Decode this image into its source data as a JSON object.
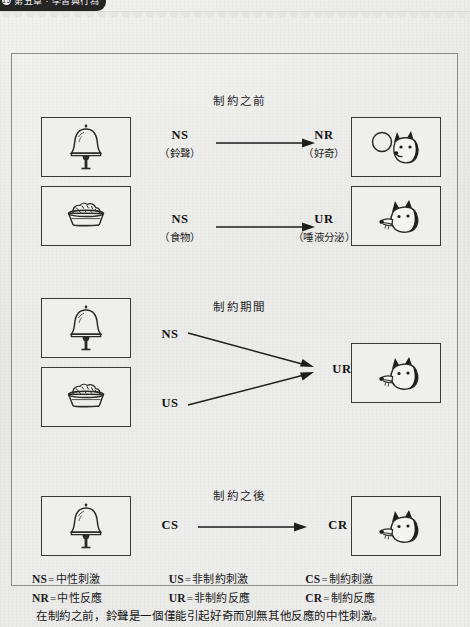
{
  "header": {
    "tab_badge": "15",
    "tab_label": "第五章 · 學習與行為"
  },
  "diagram": {
    "title_before": "制約之前",
    "title_during": "制約期間",
    "title_after": "制約之後",
    "rows": [
      {
        "id": "before-bell",
        "left_image": "bell-illustration",
        "stimulus_abbr": "NS",
        "stimulus_zh": "（鈴聲）",
        "response_abbr": "NR",
        "response_zh": "（好奇）",
        "right_image": "dog-curious-illustration"
      },
      {
        "id": "before-food",
        "left_image": "food-bowl-illustration",
        "stimulus_abbr": "NS",
        "stimulus_zh": "（食物）",
        "response_abbr": "UR",
        "response_zh": "（唾液分泌）",
        "right_image": "dog-salivating-illustration"
      },
      {
        "id": "during",
        "left_image_top": "bell-illustration",
        "left_image_bottom": "food-bowl-illustration",
        "stimulus_top_abbr": "NS",
        "stimulus_bottom_abbr": "US",
        "response_abbr": "UR",
        "right_image": "dog-salivating-illustration"
      },
      {
        "id": "after",
        "left_image": "bell-illustration",
        "stimulus_abbr": "CS",
        "response_abbr": "CR",
        "right_image": "dog-salivating-illustration"
      }
    ]
  },
  "legend": {
    "rows": [
      [
        {
          "code": "NS",
          "eq": "=",
          "text": "中性刺激"
        },
        {
          "code": "US",
          "eq": "=",
          "text": "非制約刺激"
        },
        {
          "code": "CS",
          "eq": "=",
          "text": "制約刺激"
        }
      ],
      [
        {
          "code": "NR",
          "eq": "=",
          "text": "中性反應"
        },
        {
          "code": "UR",
          "eq": "=",
          "text": "非制約反應"
        },
        {
          "code": "CR",
          "eq": "=",
          "text": "制約反應"
        }
      ]
    ]
  },
  "caption": "在制約之前，鈴聲是一個僅能引起好奇而別無其他反應的中性刺激。",
  "colors": {
    "page_background": "#ececeb",
    "frame_border": "#8d8d8c",
    "box_border": "#3a3a39",
    "ink": "#1b1b1b"
  }
}
